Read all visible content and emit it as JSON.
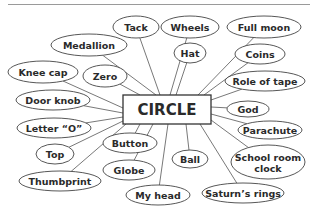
{
  "diagram": {
    "center": {
      "label": "CIRCLE",
      "x": 123,
      "y": 95,
      "w": 88,
      "h": 29
    },
    "nodes": [
      {
        "label": "Tack",
        "cx": 136,
        "cy": 27,
        "rx": 23,
        "ry": 11,
        "ax": 160,
        "ay": 95
      },
      {
        "label": "Wheels",
        "cx": 190,
        "cy": 27,
        "rx": 29,
        "ry": 11,
        "ax": 170,
        "ay": 95
      },
      {
        "label": "Full moon",
        "cx": 264,
        "cy": 27,
        "rx": 37,
        "ry": 11,
        "ax": 198,
        "ay": 95
      },
      {
        "label": "Medallion",
        "cx": 89,
        "cy": 45,
        "rx": 38,
        "ry": 11,
        "ax": 156,
        "ay": 95
      },
      {
        "label": "Hat",
        "cx": 190,
        "cy": 53,
        "rx": 16,
        "ry": 10,
        "ax": 176,
        "ay": 95
      },
      {
        "label": "Coins",
        "cx": 260,
        "cy": 54,
        "rx": 25,
        "ry": 10,
        "ax": 204,
        "ay": 95
      },
      {
        "label": "Knee cap",
        "cx": 43,
        "cy": 72,
        "rx": 35,
        "ry": 11,
        "ax": 123,
        "ay": 108
      },
      {
        "label": "Zero",
        "cx": 105,
        "cy": 76,
        "rx": 22,
        "ry": 11,
        "ax": 140,
        "ay": 95
      },
      {
        "label": "Role of tape",
        "cx": 265,
        "cy": 81,
        "rx": 40,
        "ry": 10,
        "ax": 211,
        "ay": 100
      },
      {
        "label": "Door knob",
        "cx": 53,
        "cy": 100,
        "rx": 37,
        "ry": 10,
        "ax": 123,
        "ay": 113
      },
      {
        "label": "God",
        "cx": 248,
        "cy": 109,
        "rx": 21,
        "ry": 8,
        "ax": 211,
        "ay": 107
      },
      {
        "label": "Letter “O”",
        "cx": 54,
        "cy": 128,
        "rx": 37,
        "ry": 10,
        "ax": 123,
        "ay": 117
      },
      {
        "label": "Parachute",
        "cx": 270,
        "cy": 130,
        "rx": 32,
        "ry": 9,
        "ax": 211,
        "ay": 114
      },
      {
        "label": "Button",
        "cx": 130,
        "cy": 143,
        "rx": 27,
        "ry": 10,
        "ax": 140,
        "ay": 124
      },
      {
        "label": "Top",
        "cx": 55,
        "cy": 154,
        "rx": 19,
        "ry": 10,
        "ax": 123,
        "ay": 121
      },
      {
        "label": "Ball",
        "cx": 190,
        "cy": 159,
        "rx": 18,
        "ry": 9,
        "ax": 186,
        "ay": 124
      },
      {
        "label": "School room",
        "label2": "clock",
        "cx": 268,
        "cy": 162,
        "rx": 37,
        "ry": 17,
        "ax": 211,
        "ay": 120
      },
      {
        "label": "Globe",
        "cx": 129,
        "cy": 170,
        "rx": 26,
        "ry": 10,
        "ax": 153,
        "ay": 124
      },
      {
        "label": "Thumbprint",
        "cx": 60,
        "cy": 181,
        "rx": 41,
        "ry": 10,
        "ax": 126,
        "ay": 124
      },
      {
        "label": "Saturn’s rings",
        "cx": 243,
        "cy": 193,
        "rx": 41,
        "ry": 10,
        "ax": 200,
        "ay": 124
      },
      {
        "label": "My head",
        "cx": 158,
        "cy": 195,
        "rx": 32,
        "ry": 10,
        "ax": 168,
        "ay": 124
      }
    ]
  }
}
